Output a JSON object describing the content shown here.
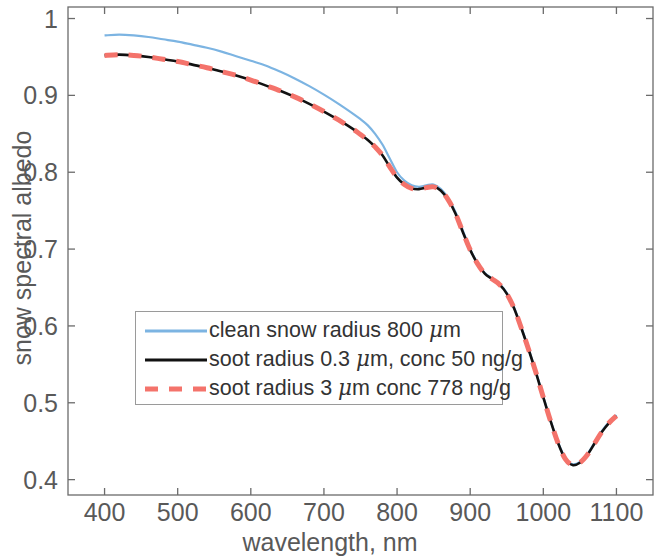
{
  "chart_data": {
    "type": "line",
    "title": "",
    "xlabel": "wavelength, nm",
    "ylabel": "snow spectral albedo",
    "xlim": [
      350,
      1150
    ],
    "ylim": [
      0.38,
      1.015
    ],
    "xticks": [
      400,
      500,
      600,
      700,
      800,
      900,
      1000,
      1100
    ],
    "xtick_labels": [
      "400",
      "500",
      "600",
      "700",
      "800",
      "900",
      "1000",
      "1100"
    ],
    "yticks": [
      0.4,
      0.5,
      0.6,
      0.7,
      0.8,
      0.9,
      1
    ],
    "ytick_labels": [
      "0.4",
      "0.5",
      "0.6",
      "0.7",
      "0.8",
      "0.9",
      "1"
    ],
    "grid": false,
    "legend_position": "center-left",
    "x": [
      400,
      420,
      440,
      460,
      480,
      500,
      520,
      540,
      560,
      580,
      600,
      620,
      640,
      660,
      680,
      700,
      720,
      740,
      750,
      760,
      770,
      780,
      790,
      800,
      810,
      820,
      830,
      840,
      850,
      860,
      870,
      880,
      890,
      900,
      910,
      920,
      930,
      940,
      950,
      960,
      970,
      980,
      990,
      1000,
      1010,
      1020,
      1030,
      1040,
      1050,
      1060,
      1070,
      1080,
      1090,
      1100
    ],
    "series": [
      {
        "name": "clean snow radius 800 μm",
        "color": "#7CB4E2",
        "style": "solid",
        "width": 2.2,
        "values": [
          0.978,
          0.979,
          0.978,
          0.976,
          0.973,
          0.97,
          0.966,
          0.962,
          0.957,
          0.951,
          0.945,
          0.939,
          0.931,
          0.922,
          0.912,
          0.901,
          0.889,
          0.876,
          0.869,
          0.861,
          0.85,
          0.836,
          0.818,
          0.8,
          0.789,
          0.783,
          0.781,
          0.783,
          0.784,
          0.778,
          0.766,
          0.748,
          0.724,
          0.7,
          0.682,
          0.669,
          0.662,
          0.655,
          0.643,
          0.624,
          0.598,
          0.57,
          0.54,
          0.508,
          0.477,
          0.449,
          0.428,
          0.42,
          0.423,
          0.433,
          0.448,
          0.463,
          0.475,
          0.484
        ]
      },
      {
        "name": "soot radius 0.3 μm, conc 50 ng/g",
        "color": "#111111",
        "style": "solid",
        "width": 2.6,
        "values": [
          0.952,
          0.953,
          0.952,
          0.95,
          0.947,
          0.944,
          0.94,
          0.936,
          0.931,
          0.926,
          0.92,
          0.913,
          0.906,
          0.898,
          0.889,
          0.879,
          0.868,
          0.856,
          0.849,
          0.842,
          0.833,
          0.822,
          0.807,
          0.793,
          0.784,
          0.779,
          0.778,
          0.78,
          0.781,
          0.776,
          0.764,
          0.746,
          0.722,
          0.699,
          0.681,
          0.668,
          0.661,
          0.654,
          0.642,
          0.623,
          0.597,
          0.569,
          0.539,
          0.507,
          0.476,
          0.448,
          0.427,
          0.419,
          0.422,
          0.432,
          0.447,
          0.462,
          0.474,
          0.483
        ]
      },
      {
        "name": "soot radius 3 μm conc 778 ng/g",
        "color": "#F4736B",
        "style": "dashed",
        "width": 5.0,
        "values": [
          0.952,
          0.953,
          0.952,
          0.95,
          0.947,
          0.944,
          0.94,
          0.936,
          0.931,
          0.926,
          0.92,
          0.913,
          0.906,
          0.898,
          0.889,
          0.879,
          0.868,
          0.856,
          0.849,
          0.842,
          0.833,
          0.822,
          0.807,
          0.793,
          0.784,
          0.779,
          0.778,
          0.78,
          0.781,
          0.776,
          0.764,
          0.746,
          0.722,
          0.699,
          0.681,
          0.668,
          0.661,
          0.654,
          0.642,
          0.623,
          0.597,
          0.569,
          0.539,
          0.507,
          0.476,
          0.448,
          0.427,
          0.419,
          0.422,
          0.432,
          0.447,
          0.462,
          0.474,
          0.483
        ]
      }
    ]
  },
  "axes": {
    "xlabel": "wavelength, nm",
    "ylabel": "snow spectral albedo",
    "xtick_labels": [
      "400",
      "500",
      "600",
      "700",
      "800",
      "900",
      "1000",
      "1100"
    ],
    "ytick_labels": [
      "1",
      "0.9",
      "0.8",
      "0.7",
      "0.6",
      "0.5",
      "0.4"
    ]
  },
  "legend": {
    "entries": [
      {
        "label_pre": "clean snow radius 800 ",
        "label_mu": "μ",
        "label_post": "m",
        "color": "#7CB4E2",
        "style": "solid"
      },
      {
        "label_pre": "soot radius 0.3 ",
        "label_mu": "μ",
        "label_post": "m, conc 50 ng/g",
        "color": "#111111",
        "style": "solid"
      },
      {
        "label_pre": "soot radius 3 ",
        "label_mu": "μ",
        "label_post": "m conc 778 ng/g",
        "color": "#F4736B",
        "style": "dashed"
      }
    ]
  },
  "colors": {
    "clean_snow": "#7CB4E2",
    "soot_small": "#111111",
    "soot_large": "#F4736B",
    "axis": "#6b6b6b",
    "text": "#595959",
    "background": "#ffffff"
  }
}
